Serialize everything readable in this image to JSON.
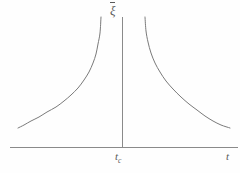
{
  "figure": {
    "kind": "divergence-plot",
    "background_color": "#fefefe",
    "line_color": "#7a7a7a",
    "axis_color": "#8a8a8a",
    "text_color": "#5a5a5a"
  },
  "labels": {
    "y_axis": "ξ",
    "y_axis_name": "xi-bar",
    "x_axis_critical": "t",
    "x_axis_critical_subscript": "c",
    "x_axis": "t"
  },
  "chart_data": {
    "type": "line",
    "title": "",
    "xlabel": "t",
    "ylabel": "ξ",
    "grid": false,
    "legend": null,
    "annotations": [
      {
        "text": "t_c",
        "x": 1.0,
        "role": "critical-point-tick"
      }
    ],
    "axis": {
      "x_axis_y_pixel": 147,
      "x_axis_x_start_pixel": 10,
      "x_axis_x_end_pixel": 238,
      "y_axis_x_pixel": 122,
      "y_axis_y_top_pixel": 17,
      "y_axis_y_bottom_pixel": 147
    },
    "asymptote": {
      "x": 1.0,
      "label": "t_c",
      "vertical": true
    },
    "series": [
      {
        "name": "branch-left",
        "comment": "diverging correlation length approaching t_c from below",
        "points": [
          [
            18,
            128
          ],
          [
            24,
            125
          ],
          [
            31,
            121
          ],
          [
            39,
            117
          ],
          [
            47,
            112
          ],
          [
            56,
            107
          ],
          [
            64,
            101
          ],
          [
            71,
            95
          ],
          [
            78,
            88
          ],
          [
            84,
            80
          ],
          [
            89,
            72
          ],
          [
            93,
            63
          ],
          [
            96,
            54
          ],
          [
            98,
            44
          ],
          [
            100,
            33
          ],
          [
            101,
            17
          ]
        ]
      },
      {
        "name": "branch-right",
        "comment": "diverging correlation length approaching t_c from above",
        "points": [
          [
            145,
            17
          ],
          [
            146,
            31
          ],
          [
            148,
            42
          ],
          [
            151,
            53
          ],
          [
            155,
            63
          ],
          [
            160,
            72
          ],
          [
            166,
            81
          ],
          [
            173,
            89
          ],
          [
            181,
            97
          ],
          [
            189,
            104
          ],
          [
            197,
            110
          ],
          [
            205,
            116
          ],
          [
            213,
            121
          ],
          [
            221,
            125
          ],
          [
            230,
            128
          ]
        ]
      }
    ]
  }
}
